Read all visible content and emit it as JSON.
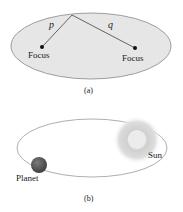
{
  "figure_a": {
    "caption": "(a)",
    "focus_left_label": "Focus",
    "focus_right_label": "Focus",
    "distance_p_label": "p",
    "distance_q_label": "q",
    "ellipse_fill": "#e6e6e6",
    "ellipse_stroke": "#888888"
  },
  "figure_b": {
    "caption": "(b)",
    "planet_label": "Planet",
    "sun_label": "Sun",
    "planet_color": "#5a5a5a",
    "orbit_stroke": "#999999"
  }
}
